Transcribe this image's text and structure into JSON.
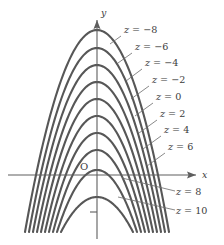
{
  "figure": {
    "name": "level-curves-contour-plot",
    "background": "#ffffff",
    "curve_color": "#575757",
    "axis_color": "#5e5e5e",
    "text_color": "#3b3b3b"
  },
  "axes": {
    "x_label": "x",
    "y_label": "y",
    "origin_label": "O",
    "x_axis_y_px": 175,
    "y_axis_x_px": 97,
    "x_tick_below_origin": true
  },
  "chart_data": {
    "type": "line",
    "title": "",
    "xlabel": "x",
    "ylabel": "y",
    "grid": false,
    "legend": "inline-curve-labels",
    "contour_variable": "z",
    "contour_levels": [
      -8,
      -6,
      -4,
      -2,
      0,
      2,
      4,
      6,
      8,
      10
    ],
    "labels": [
      "z = -8",
      "z = -6",
      "z = -4",
      "z = -2",
      "z = 0",
      "z = 2",
      "z = 4",
      "z = 6",
      "z = 8",
      "z = 10"
    ],
    "series": [
      {
        "name": "z = -8",
        "level": -8,
        "vertex_px": [
          97,
          30
        ],
        "half_width_px": 72,
        "bottom_px": 232
      },
      {
        "name": "z = -6",
        "level": -6,
        "vertex_px": [
          97,
          48
        ],
        "half_width_px": 68,
        "bottom_px": 232
      },
      {
        "name": "z = -4",
        "level": -4,
        "vertex_px": [
          97,
          65
        ],
        "half_width_px": 64,
        "bottom_px": 232
      },
      {
        "name": "z = -2",
        "level": -2,
        "vertex_px": [
          97,
          82
        ],
        "half_width_px": 60,
        "bottom_px": 232
      },
      {
        "name": "z = 0",
        "level": 0,
        "vertex_px": [
          97,
          99
        ],
        "half_width_px": 56,
        "bottom_px": 232
      },
      {
        "name": "z = 2",
        "level": 2,
        "vertex_px": [
          97,
          116
        ],
        "half_width_px": 52,
        "bottom_px": 232
      },
      {
        "name": "z = 4",
        "level": 4,
        "vertex_px": [
          97,
          133
        ],
        "half_width_px": 48,
        "bottom_px": 232
      },
      {
        "name": "z = 6",
        "level": 6,
        "vertex_px": [
          97,
          150
        ],
        "half_width_px": 44,
        "bottom_px": 232
      },
      {
        "name": "z = 8",
        "level": 8,
        "vertex_px": [
          97,
          170
        ],
        "half_width_px": 40,
        "bottom_px": 232
      },
      {
        "name": "z = 10",
        "level": 10,
        "vertex_px": [
          97,
          197
        ],
        "half_width_px": 36,
        "bottom_px": 232
      }
    ],
    "annotations": [
      {
        "text": "z = -8",
        "x_px": 124,
        "y_px": 33,
        "leader": [
          [
            121,
            36
          ],
          [
            110,
            44
          ]
        ]
      },
      {
        "text": "z = -6",
        "x_px": 135,
        "y_px": 50,
        "leader": [
          [
            132,
            53
          ],
          [
            118,
            63
          ]
        ]
      },
      {
        "text": "z = -4",
        "x_px": 145,
        "y_px": 66,
        "leader": [
          [
            142,
            69
          ],
          [
            126,
            81
          ]
        ]
      },
      {
        "text": "z = -2",
        "x_px": 152,
        "y_px": 83,
        "leader": [
          [
            149,
            86
          ],
          [
            131,
            99
          ]
        ]
      },
      {
        "text": "z = 0",
        "x_px": 156,
        "y_px": 100,
        "leader": [
          [
            153,
            103
          ],
          [
            135,
            116
          ]
        ]
      },
      {
        "text": "z = 2",
        "x_px": 160,
        "y_px": 117,
        "leader": [
          [
            157,
            120
          ],
          [
            139,
            133
          ]
        ]
      },
      {
        "text": "z = 4",
        "x_px": 164,
        "y_px": 133,
        "leader": [
          [
            161,
            136
          ],
          [
            143,
            149
          ]
        ]
      },
      {
        "text": "z = 6",
        "x_px": 168,
        "y_px": 150,
        "leader": [
          [
            165,
            153
          ],
          [
            147,
            166
          ]
        ]
      },
      {
        "text": "z = 8",
        "x_px": 176,
        "y_px": 195,
        "leader": [
          [
            175,
            191
          ],
          [
            122,
            178
          ]
        ]
      },
      {
        "text": "z = 10",
        "x_px": 176,
        "y_px": 214,
        "leader": [
          [
            175,
            210
          ],
          [
            118,
            197
          ]
        ]
      }
    ]
  }
}
